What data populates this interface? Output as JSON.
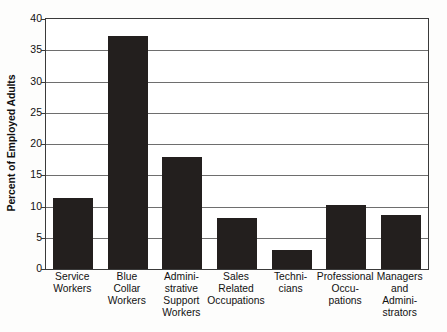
{
  "chart_data": {
    "type": "bar",
    "title": "",
    "xlabel": "",
    "ylabel": "Percent of Employed Adults",
    "ylim": [
      0,
      40
    ],
    "ytick_step": 5,
    "yticks": [
      "40",
      "35",
      "30",
      "25",
      "20",
      "15",
      "10",
      "5",
      "0"
    ],
    "grid": true,
    "legend": "none",
    "bar_color": "#231f1e",
    "categories": [
      "Service Workers",
      "Blue Collar Workers",
      "Administrative Support Workers",
      "Sales Related Occupations",
      "Technicians",
      "Professional Occupations",
      "Managers and Administrators"
    ],
    "category_label_lines": [
      [
        "Service",
        "Workers"
      ],
      [
        "Blue",
        "Collar",
        "Workers"
      ],
      [
        "Admini-",
        "strative",
        "Support",
        "Workers"
      ],
      [
        "Sales",
        "Related",
        "Occupations"
      ],
      [
        "Techni-",
        "cians"
      ],
      [
        "Professional",
        "Occu-",
        "pations"
      ],
      [
        "Managers",
        "and",
        "Admini-",
        "strators"
      ]
    ],
    "values": [
      11.4,
      37.3,
      18.0,
      8.2,
      3.1,
      10.2,
      8.7
    ]
  }
}
